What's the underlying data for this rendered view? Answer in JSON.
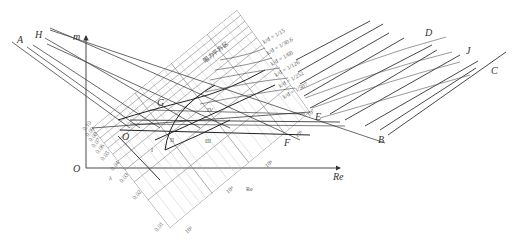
{
  "figure": {
    "axes": {
      "vertical_label": "m",
      "horizontal_label": "Re",
      "origin_label": "O",
      "inner_origin_label": "O",
      "lambda_label": "λ",
      "re_inner_label": "Re"
    },
    "point_labels": {
      "A": "A",
      "H": "H",
      "D": "D",
      "J": "J",
      "C": "C",
      "G": "G",
      "E": "E",
      "B": "B",
      "F": "F"
    },
    "region_labels": [
      "I",
      "II",
      "III",
      "IV"
    ],
    "zone_text": "阻力平方区",
    "lambda_ticks": [
      "0.10",
      "0.09",
      "0.08",
      "0.07",
      "0.06",
      "0.05",
      "0.04",
      "0.03",
      "0.02",
      "0.01"
    ],
    "re_ticks": [
      "10³",
      "10⁴",
      "10⁵",
      "10⁶",
      "10⁷"
    ],
    "roughness_labels": [
      "k/d = 1/15",
      "k/d = 1/30.6",
      "k/d = 1/60",
      "k/d = 1/126",
      "k/d = 1/252",
      "k/d = 1/507"
    ],
    "colors": {
      "line": "#333333",
      "grid": "#8a8a8a",
      "fine_grid": "#b8b8b8"
    }
  }
}
